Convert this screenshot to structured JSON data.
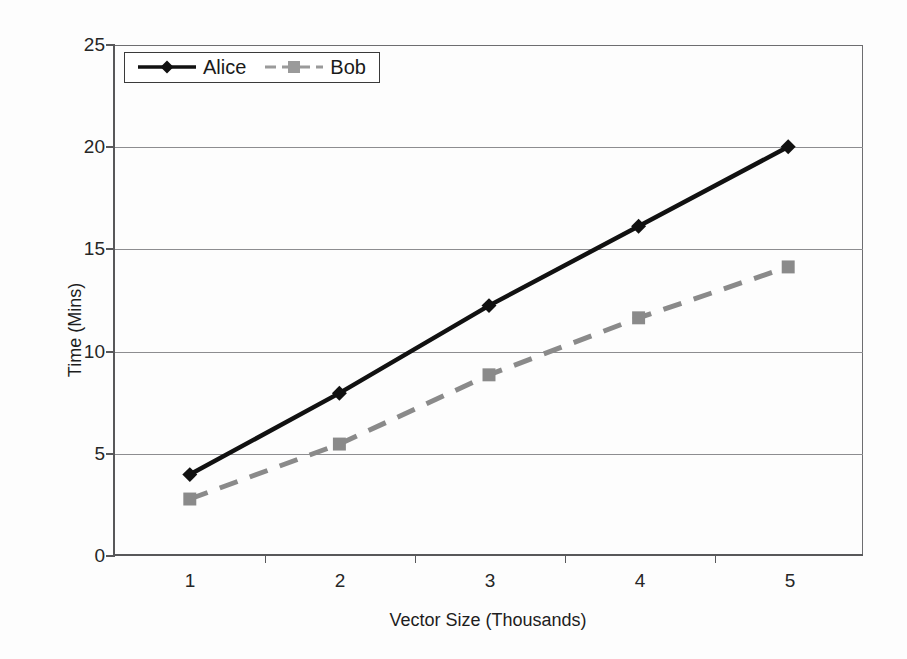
{
  "chart_data": {
    "type": "line",
    "title": "",
    "xlabel": "Vector Size (Thousands)",
    "ylabel": "Time (Mins)",
    "categories": [
      "1",
      "2",
      "3",
      "4",
      "5"
    ],
    "x": [
      1,
      2,
      3,
      4,
      5
    ],
    "ylim": [
      0,
      25
    ],
    "yticks": [
      "0",
      "5",
      "10",
      "15",
      "20",
      "25"
    ],
    "ytick_values": [
      0,
      5,
      10,
      15,
      20,
      25
    ],
    "grid": "horizontal",
    "legend_position": "top-left",
    "series": [
      {
        "name": "Alice",
        "values": [
          3.9,
          7.9,
          12.2,
          16.1,
          20.0
        ],
        "color": "#111111",
        "line_style": "solid",
        "marker": "diamond"
      },
      {
        "name": "Bob",
        "values": [
          2.7,
          5.4,
          8.8,
          11.6,
          14.1
        ],
        "color": "#8a8a8a",
        "line_style": "dashed",
        "marker": "square"
      }
    ]
  },
  "legend": {
    "entries": [
      {
        "label": "Alice"
      },
      {
        "label": "Bob"
      }
    ]
  },
  "axes": {
    "y_title": "Time (Mins)",
    "x_title": "Vector Size (Thousands)"
  }
}
